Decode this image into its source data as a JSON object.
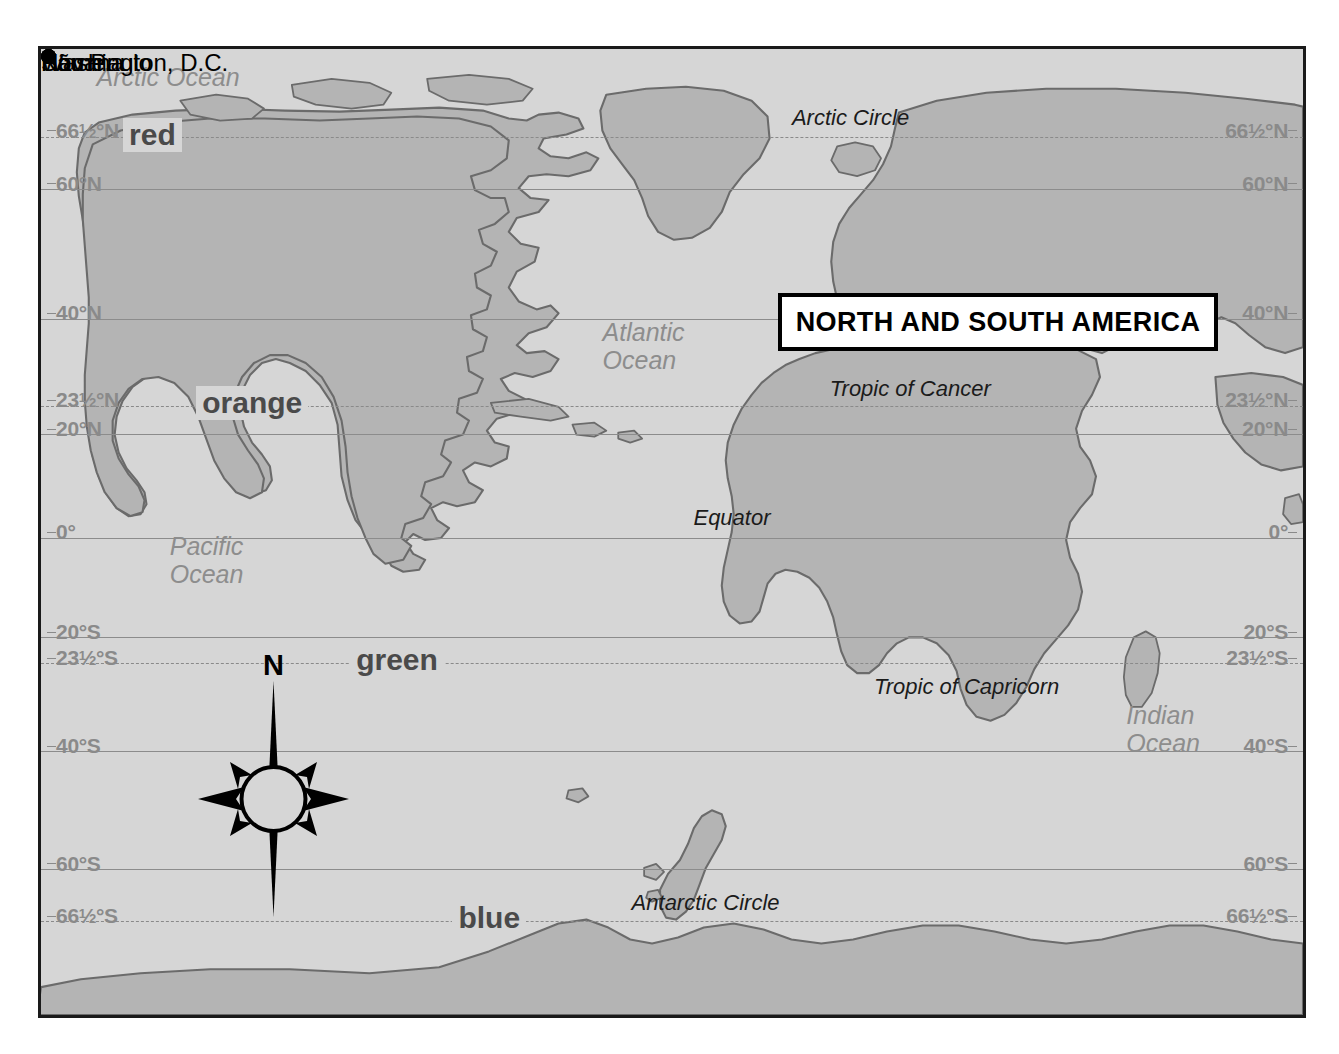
{
  "title": {
    "text": "NORTH AND SOUTH AMERICA"
  },
  "latitudes": [
    {
      "id": "arctic-circle",
      "label_left": "66",
      "frac_num": "1",
      "frac_den": "2",
      "label_suffix": "°N",
      "full": "66½°N",
      "value": 66.5,
      "style": "dashed",
      "y_pct": 9.1
    },
    {
      "id": "lat-60n",
      "label_left": "60",
      "frac_num": "",
      "frac_den": "",
      "label_suffix": "°N",
      "full": "60°N",
      "value": 60.0,
      "style": "solid",
      "y_pct": 14.5
    },
    {
      "id": "lat-40n",
      "label_left": "40",
      "frac_num": "",
      "frac_den": "",
      "label_suffix": "°N",
      "full": "40°N",
      "value": 40.0,
      "style": "solid",
      "y_pct": 27.9
    },
    {
      "id": "tropic-of-cancer",
      "label_left": "23",
      "frac_num": "1",
      "frac_den": "2",
      "label_suffix": "°N",
      "full": "23½°N",
      "value": 23.5,
      "style": "dashed",
      "y_pct": 37.0
    },
    {
      "id": "lat-20n",
      "label_left": "20",
      "frac_num": "",
      "frac_den": "",
      "label_suffix": "°N",
      "full": "20°N",
      "value": 20.0,
      "style": "solid",
      "y_pct": 39.9
    },
    {
      "id": "equator",
      "label_left": "0",
      "frac_num": "",
      "frac_den": "",
      "label_suffix": "°",
      "full": "0°",
      "value": 0.0,
      "style": "solid",
      "y_pct": 50.6
    },
    {
      "id": "lat-20s",
      "label_left": "20",
      "frac_num": "",
      "frac_den": "",
      "label_suffix": "°S",
      "full": "20°S",
      "value": -20.0,
      "style": "solid",
      "y_pct": 60.9
    },
    {
      "id": "tropic-of-capricorn",
      "label_left": "23",
      "frac_num": "1",
      "frac_den": "2",
      "label_suffix": "°S",
      "full": "23½°S",
      "value": -23.5,
      "style": "dashed",
      "y_pct": 63.6
    },
    {
      "id": "lat-40s",
      "label_left": "40",
      "frac_num": "",
      "frac_den": "",
      "label_suffix": "°S",
      "full": "40°S",
      "value": -40.0,
      "style": "solid",
      "y_pct": 72.7
    },
    {
      "id": "lat-60s",
      "label_left": "60",
      "frac_num": "",
      "frac_den": "",
      "label_suffix": "°S",
      "full": "60°S",
      "value": -60.0,
      "style": "solid",
      "y_pct": 84.9
    },
    {
      "id": "antarctic-circle",
      "label_left": "66",
      "frac_num": "1",
      "frac_den": "2",
      "label_suffix": "°S",
      "full": "66½°S",
      "value": -66.5,
      "style": "dashed",
      "y_pct": 90.3
    }
  ],
  "line_labels": [
    {
      "id": "arctic-circle-label",
      "text": "Arctic Circle",
      "x_pct": 59.5,
      "y_pct": 5.8
    },
    {
      "id": "tropic-of-cancer-label",
      "text": "Tropic of Cancer",
      "x_pct": 62.5,
      "y_pct": 33.8
    },
    {
      "id": "equator-label",
      "text": "Equator",
      "x_pct": 51.7,
      "y_pct": 47.2
    },
    {
      "id": "tropic-of-capricorn-label",
      "text": "Tropic of Capricorn",
      "x_pct": 66.0,
      "y_pct": 64.7
    },
    {
      "id": "antarctic-circle-label",
      "text": "Antarctic Circle",
      "x_pct": 46.8,
      "y_pct": 87.1
    }
  ],
  "oceans": [
    {
      "id": "arctic-ocean",
      "name": "Arctic Ocean",
      "text": "Arctic Ocean",
      "x_pct": 4.4,
      "y_pct": 1.4
    },
    {
      "id": "atlantic-ocean",
      "name": "Atlantic Ocean",
      "text": "Atlantic\nOcean",
      "x_pct": 44.5,
      "y_pct": 27.8
    },
    {
      "id": "pacific-ocean",
      "name": "Pacific Ocean",
      "text": "Pacific\nOcean",
      "x_pct": 10.2,
      "y_pct": 50.0
    },
    {
      "id": "indian-ocean",
      "name": "Indian Ocean",
      "text": "Indian\nOcean",
      "x_pct": 86.0,
      "y_pct": 67.5
    }
  ],
  "color_notes": [
    {
      "id": "note-red",
      "text": "red",
      "color_name": "red",
      "on_line": "66½°N",
      "x_pct": 6.5,
      "y_pct": 7.1
    },
    {
      "id": "note-orange",
      "text": "orange",
      "color_name": "orange",
      "on_line": "23½°N",
      "x_pct": 12.3,
      "y_pct": 34.9
    },
    {
      "id": "note-green",
      "text": "green",
      "color_name": "green",
      "on_line": "23½°S",
      "x_pct": 24.5,
      "y_pct": 61.5
    },
    {
      "id": "note-blue",
      "text": "blue",
      "color_name": "blue",
      "on_line": "66½°S",
      "x_pct": 32.6,
      "y_pct": 88.2
    }
  ],
  "cities": [
    {
      "id": "nome",
      "name": "Nome",
      "dot_x_pct": 4.3,
      "dot_y_pct": 10.3,
      "label_side": "right",
      "label_dx": 14,
      "label_dy": -4
    },
    {
      "id": "washington-dc",
      "name": "Washington, D.C.",
      "dot_x_pct": 37.0,
      "dot_y_pct": 28.6,
      "label_side": "left",
      "label_dx": -14,
      "label_dy": -4
    },
    {
      "id": "havana",
      "name": "Havana",
      "dot_x_pct": 35.8,
      "dot_y_pct": 36.9,
      "label_side": "right",
      "label_dx": 14,
      "label_dy": -13
    },
    {
      "id": "sao-paulo",
      "name": "São Paulo",
      "dot_x_pct": 48.5,
      "dot_y_pct": 64.0,
      "label_side": "right",
      "label_dx": 14,
      "label_dy": 2
    }
  ],
  "compass": {
    "north_label": "N"
  },
  "colors": {
    "ocean_fill": "#d6d6d6",
    "land_fill": "#b4b4b4",
    "land_stroke": "#6a6a6a",
    "grid_line": "#8c8c8c",
    "lat_label": "#8a8a8a",
    "map_border": "#1a1a1a",
    "city_dot": "#000000",
    "title_bg": "#ffffff",
    "title_border": "#000000",
    "page_bg": "#ffffff"
  },
  "map_meta": {
    "projection_note": "world map centered on the Americas",
    "frame_label": "world-map-frame"
  }
}
